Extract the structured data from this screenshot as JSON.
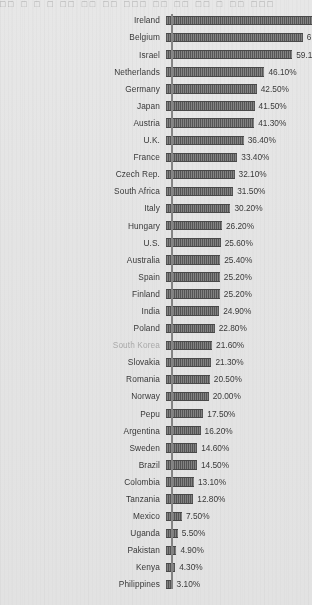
{
  "top_cut_text": "□□ □ □ □ □□ □□ □□ □□□ □□ □□ □□ □ □□ □□□",
  "colors": {
    "background": "#f2f2f2",
    "bar_fill": "#6e6e6e",
    "bar_stroke": "#4d4d4d",
    "axis": "#8d8d8d",
    "label_text": "#3b3b3b",
    "muted_label_text": "#b4b4b4"
  },
  "chart_data": {
    "type": "bar",
    "orientation": "horizontal",
    "title": "",
    "subtitle": "",
    "xlabel": "",
    "ylabel": "",
    "xlim": [
      0,
      70
    ],
    "grid": false,
    "legend": null,
    "value_suffix": "%",
    "notes": [
      "Top two bars (Ireland, Belgium) extend beyond the right image edge; their data labels are clipped.",
      "Row label 'South Korea' is rendered in a lighter gray than the other labels.",
      "Row label reads 'Pepu' as printed in the source scan."
    ],
    "categories": [
      "Ireland",
      "Belgium",
      "Israel",
      "Netherlands",
      "Germany",
      "Japan",
      "Austria",
      "U.K.",
      "France",
      "Czech Rep.",
      "South Africa",
      "Italy",
      "Hungary",
      "U.S.",
      "Australia",
      "Spain",
      "Finland",
      "India",
      "Poland",
      "South Korea",
      "Slovakia",
      "Romania",
      "Norway",
      "Pepu",
      "Argentina",
      "Sweden",
      "Brazil",
      "Colombia",
      "Tanzania",
      "Mexico",
      "Uganda",
      "Pakistan",
      "Kenya",
      "Philippines"
    ],
    "values": [
      68.5,
      64.0,
      59.1,
      46.1,
      42.5,
      41.5,
      41.3,
      36.4,
      33.4,
      32.1,
      31.5,
      30.2,
      26.2,
      25.6,
      25.4,
      25.2,
      25.2,
      24.9,
      22.8,
      21.6,
      21.3,
      20.5,
      20.0,
      17.5,
      16.2,
      14.6,
      14.5,
      13.1,
      12.8,
      7.5,
      5.5,
      4.9,
      4.3,
      3.1
    ]
  },
  "rows": [
    {
      "label": "Ireland",
      "value_label": "",
      "value": 68.5,
      "muted": false,
      "clipped": true
    },
    {
      "label": "Belgium",
      "value_label": "6",
      "value": 64.0,
      "muted": false,
      "clipped": true
    },
    {
      "label": "Israel",
      "value_label": "59.10%",
      "value": 59.1,
      "muted": false,
      "clipped": false
    },
    {
      "label": "Netherlands",
      "value_label": "46.10%",
      "value": 46.1,
      "muted": false,
      "clipped": false
    },
    {
      "label": "Germany",
      "value_label": "42.50%",
      "value": 42.5,
      "muted": false,
      "clipped": false
    },
    {
      "label": "Japan",
      "value_label": "41.50%",
      "value": 41.5,
      "muted": false,
      "clipped": false
    },
    {
      "label": "Austria",
      "value_label": "41.30%",
      "value": 41.3,
      "muted": false,
      "clipped": false
    },
    {
      "label": "U.K.",
      "value_label": "36.40%",
      "value": 36.4,
      "muted": false,
      "clipped": false
    },
    {
      "label": "France",
      "value_label": "33.40%",
      "value": 33.4,
      "muted": false,
      "clipped": false
    },
    {
      "label": "Czech Rep.",
      "value_label": "32.10%",
      "value": 32.1,
      "muted": false,
      "clipped": false
    },
    {
      "label": "South Africa",
      "value_label": "31.50%",
      "value": 31.5,
      "muted": false,
      "clipped": false
    },
    {
      "label": "Italy",
      "value_label": "30.20%",
      "value": 30.2,
      "muted": false,
      "clipped": false
    },
    {
      "label": "Hungary",
      "value_label": "26.20%",
      "value": 26.2,
      "muted": false,
      "clipped": false
    },
    {
      "label": "U.S.",
      "value_label": "25.60%",
      "value": 25.6,
      "muted": false,
      "clipped": false
    },
    {
      "label": "Australia",
      "value_label": "25.40%",
      "value": 25.4,
      "muted": false,
      "clipped": false
    },
    {
      "label": "Spain",
      "value_label": "25.20%",
      "value": 25.2,
      "muted": false,
      "clipped": false
    },
    {
      "label": "Finland",
      "value_label": "25.20%",
      "value": 25.2,
      "muted": false,
      "clipped": false
    },
    {
      "label": "India",
      "value_label": "24.90%",
      "value": 24.9,
      "muted": false,
      "clipped": false
    },
    {
      "label": "Poland",
      "value_label": "22.80%",
      "value": 22.8,
      "muted": false,
      "clipped": false
    },
    {
      "label": "South Korea",
      "value_label": "21.60%",
      "value": 21.6,
      "muted": true,
      "clipped": false
    },
    {
      "label": "Slovakia",
      "value_label": "21.30%",
      "value": 21.3,
      "muted": false,
      "clipped": false
    },
    {
      "label": "Romania",
      "value_label": "20.50%",
      "value": 20.5,
      "muted": false,
      "clipped": false
    },
    {
      "label": "Norway",
      "value_label": "20.00%",
      "value": 20.0,
      "muted": false,
      "clipped": false
    },
    {
      "label": "Pepu",
      "value_label": "17.50%",
      "value": 17.5,
      "muted": false,
      "clipped": false
    },
    {
      "label": "Argentina",
      "value_label": "16.20%",
      "value": 16.2,
      "muted": false,
      "clipped": false
    },
    {
      "label": "Sweden",
      "value_label": "14.60%",
      "value": 14.6,
      "muted": false,
      "clipped": false
    },
    {
      "label": "Brazil",
      "value_label": "14.50%",
      "value": 14.5,
      "muted": false,
      "clipped": false
    },
    {
      "label": "Colombia",
      "value_label": "13.10%",
      "value": 13.1,
      "muted": false,
      "clipped": false
    },
    {
      "label": "Tanzania",
      "value_label": "12.80%",
      "value": 12.8,
      "muted": false,
      "clipped": false
    },
    {
      "label": "Mexico",
      "value_label": "7.50%",
      "value": 7.5,
      "muted": false,
      "clipped": false
    },
    {
      "label": "Uganda",
      "value_label": "5.50%",
      "value": 5.5,
      "muted": false,
      "clipped": false
    },
    {
      "label": "Pakistan",
      "value_label": "4.90%",
      "value": 4.9,
      "muted": false,
      "clipped": false
    },
    {
      "label": "Kenya",
      "value_label": "4.30%",
      "value": 4.3,
      "muted": false,
      "clipped": false
    },
    {
      "label": "Philippines",
      "value_label": "3.10%",
      "value": 3.1,
      "muted": false,
      "clipped": false
    }
  ]
}
